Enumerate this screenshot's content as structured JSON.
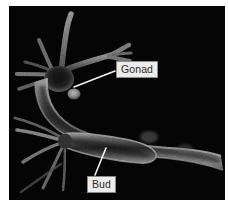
{
  "figure": {
    "kind": "dark-field micrograph",
    "plate": {
      "background_color": "#050505",
      "page_background_color": "#ffffff",
      "left": 9,
      "top": 6,
      "width": 216,
      "height": 194
    }
  },
  "callouts": [
    {
      "id": "gonad",
      "label": "Gonad",
      "box": {
        "left": 116,
        "top": 61
      },
      "leader": {
        "from_x": 115,
        "from_y": 71,
        "to_x": 74,
        "to_y": 87
      },
      "box_fill": "#ececec",
      "box_border": "#8a8a8a",
      "text_color": "#2b2b2b",
      "leader_color": "#f2f2f2"
    },
    {
      "id": "bud",
      "label": "Bud",
      "box": {
        "left": 87,
        "top": 176
      },
      "leader": {
        "from_x": 95,
        "from_y": 175,
        "to_x": 106,
        "to_y": 148
      },
      "box_fill": "#ececec",
      "box_border": "#8a8a8a",
      "text_color": "#2b2b2b",
      "leader_color": "#f2f2f2"
    }
  ],
  "anatomy": {
    "tentacles_label": "tentacles",
    "body_column_label": "body column",
    "gonad_bump_label": "gonad bump",
    "bud_label": "bud",
    "tissue_highlight_color": "#b9b9b9",
    "tissue_mid_color": "#6e6e6e",
    "tissue_shadow_color": "#141414"
  }
}
